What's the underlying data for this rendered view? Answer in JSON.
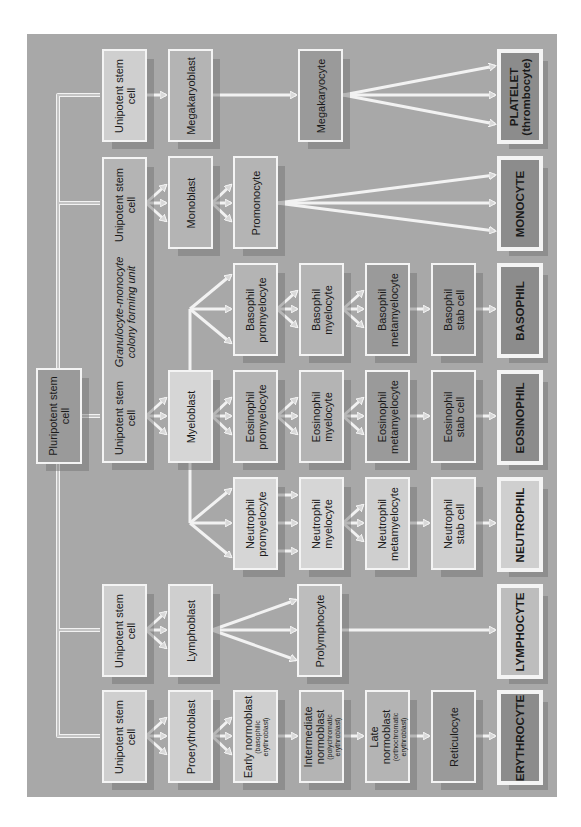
{
  "diagram": {
    "orientation": "rotated-90-ccw",
    "root": "Pluripotent stem cell",
    "nodes": {
      "pluripotent": "Pluripotent stem cell",
      "uni_platelet": "Unipotent stem cell",
      "megakaryoblast": "Megakaryoblast",
      "megakaryocyte": "Megakaryocyte",
      "platelet": "PLATELET",
      "platelet_sub": "(thrombocyte)",
      "uni_monocyte": "Unipotent stem cell",
      "gm_unit_line1": "Granulocyte-monocyte",
      "gm_unit_line2": "colony forming unit",
      "uni_granulocyte": "Unipotent stem cell",
      "monoblast": "Monoblast",
      "promonocyte": "Promonocyte",
      "monocyte": "MONOCYTE",
      "myeloblast": "Myeloblast",
      "baso_promyelocyte": "Basophil promyelocyte",
      "baso_myelocyte": "Basophil myelocyte",
      "baso_metamyelocyte": "Basophil metamyelocyte",
      "baso_stab": "Basophil stab cell",
      "basophil": "BASOPHIL",
      "eos_promyelocyte": "Eosinophil promyelocyte",
      "eos_myelocyte": "Eosinophil myelocyte",
      "eos_metamyelocyte": "Eosinophil metamyelocyte",
      "eos_stab": "Eosinophil stab cell",
      "eosinophil": "EOSINOPHIL",
      "neu_promyelocyte": "Neutrophil promyelocyte",
      "neu_myelocyte": "Neutrophil myelocyte",
      "neu_metamyelocyte": "Neutrophil metamyelocyte",
      "neu_stab": "Neutrophil stab cell",
      "neutrophil": "NEUTROPHIL",
      "uni_lymphocyte": "Unipotent stem cell",
      "lymphoblast": "Lymphoblast",
      "prolymphocyte": "Prolymphocyte",
      "lymphocyte": "LYMPHOCYTE",
      "uni_erythrocyte": "Unipotent stem cell",
      "proerythroblast": "Proerythroblast",
      "early_normoblast": "Early normoblast",
      "early_normoblast_sub": "(basophilic erythroblast)",
      "intermediate_normoblast": "Intermediate normoblast",
      "intermediate_normoblast_sub": "(polychromatic erythroblast)",
      "late_normoblast": "Late normoblast",
      "late_normoblast_sub": "(orthochromatic erythroblast)",
      "reticulocyte": "Reticulocyte",
      "erythrocyte": "ERYTHROCYTE"
    },
    "lineages": [
      {
        "final": "PLATELET (thrombocyte)",
        "path": [
          "Unipotent stem cell",
          "Megakaryoblast",
          "Megakaryocyte",
          "PLATELET (thrombocyte)"
        ]
      },
      {
        "final": "MONOCYTE",
        "path": [
          "Unipotent stem cell",
          "Monoblast",
          "Promonocyte",
          "MONOCYTE"
        ]
      },
      {
        "final": "BASOPHIL",
        "path": [
          "Unipotent stem cell",
          "Myeloblast",
          "Basophil promyelocyte",
          "Basophil myelocyte",
          "Basophil metamyelocyte",
          "Basophil stab cell",
          "BASOPHIL"
        ]
      },
      {
        "final": "EOSINOPHIL",
        "path": [
          "Unipotent stem cell",
          "Myeloblast",
          "Eosinophil promyelocyte",
          "Eosinophil myelocyte",
          "Eosinophil metamyelocyte",
          "Eosinophil stab cell",
          "EOSINOPHIL"
        ]
      },
      {
        "final": "NEUTROPHIL",
        "path": [
          "Unipotent stem cell",
          "Myeloblast",
          "Neutrophil promyelocyte",
          "Neutrophil myelocyte",
          "Neutrophil metamyelocyte",
          "Neutrophil stab cell",
          "NEUTROPHIL"
        ]
      },
      {
        "final": "LYMPHOCYTE",
        "path": [
          "Unipotent stem cell",
          "Lymphoblast",
          "Prolymphocyte",
          "LYMPHOCYTE"
        ]
      },
      {
        "final": "ERYTHROCYTE",
        "path": [
          "Unipotent stem cell",
          "Proerythroblast",
          "Early normoblast",
          "Intermediate normoblast",
          "Late normoblast",
          "Reticulocyte",
          "ERYTHROCYTE"
        ]
      }
    ],
    "colors": {
      "panel": "#a8a8a8",
      "border": "#f4f4f4",
      "light": "#cfcfcf",
      "mid": "#b4b4b4",
      "dark": "#9a9a9a",
      "darker": "#8c8c8c"
    }
  }
}
